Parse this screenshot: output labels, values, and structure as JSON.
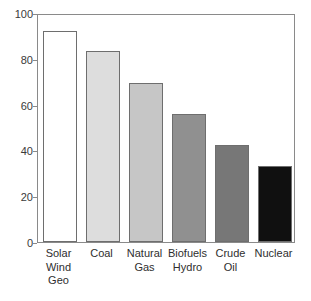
{
  "chart_data": {
    "type": "bar",
    "title": "",
    "subtitle": "",
    "xlabel": "",
    "ylabel": "",
    "categories": [
      "Solar Wind Geo",
      "Coal",
      "Natural Gas",
      "Biofuels Hydro",
      "Crude Oil",
      "Nuclear"
    ],
    "category_lines": [
      [
        "Solar",
        "Wind",
        "Geo"
      ],
      [
        "Coal"
      ],
      [
        "Natural",
        "Gas"
      ],
      [
        "Biofuels",
        "Hydro"
      ],
      [
        "Crude",
        "Oil"
      ],
      [
        "Nuclear"
      ]
    ],
    "values": [
      92,
      83.5,
      69.5,
      56,
      42.5,
      33
    ],
    "bar_colors": [
      "#ffffff",
      "#dddddd",
      "#c6c6c6",
      "#909090",
      "#777777",
      "#101010"
    ],
    "bar_edge_color": "#6e6e6e",
    "ylim": [
      0,
      100
    ],
    "yticks": [
      0,
      20,
      40,
      60,
      80,
      100
    ],
    "ytick_labels": [
      "0",
      "20",
      "40",
      "60",
      "80",
      "100"
    ],
    "grid": false,
    "legend": null,
    "annotations": []
  },
  "axis": {
    "y": {
      "t0": "0",
      "t20": "20",
      "t40": "40",
      "t60": "60",
      "t80": "80",
      "t100": "100"
    }
  },
  "labels": {
    "c0l0": "Solar",
    "c0l1": "Wind",
    "c0l2": "Geo",
    "c1l0": "Coal",
    "c2l0": "Natural",
    "c2l1": "Gas",
    "c3l0": "Biofuels",
    "c3l1": "Hydro",
    "c4l0": "Crude",
    "c4l1": "Oil",
    "c5l0": "Nuclear"
  }
}
